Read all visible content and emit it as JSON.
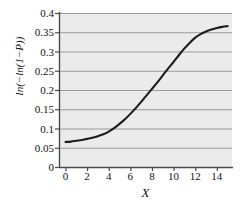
{
  "chart_data": {
    "type": "line",
    "title": "",
    "subtitle": "",
    "xlabel": "X",
    "ylabel": "ln(−ln(1−P))",
    "xlim": [
      -0.6,
      15.4
    ],
    "ylim": [
      0,
      0.4
    ],
    "xticks": [
      0,
      2,
      4,
      6,
      8,
      10,
      12,
      14
    ],
    "xtick_labels": [
      "0",
      "2",
      "4",
      "6",
      "8",
      "10",
      "12",
      "14"
    ],
    "yticks": [
      0,
      0.05,
      0.1,
      0.15,
      0.2,
      0.25,
      0.3,
      0.35,
      0.4
    ],
    "ytick_labels": [
      "0",
      "0.05",
      "0.1",
      "0.15",
      "0.2",
      "0.25",
      "0.3",
      "0.35",
      "0.4"
    ],
    "grid": "horizontal",
    "legend": "none",
    "plot_background": "#ebebeb",
    "grid_color": "#9a9a9a",
    "axis_color": "#4a4a4a",
    "line_color": "#1c1c1c",
    "line_width": 2.1,
    "series": [
      {
        "name": "ln(-ln(1-P))",
        "x": [
          0,
          0.5,
          1,
          1.5,
          2,
          2.5,
          3,
          3.5,
          4,
          4.5,
          5,
          5.5,
          6,
          6.5,
          7,
          7.5,
          8,
          8.5,
          9,
          9.5,
          10,
          10.5,
          11,
          11.5,
          12,
          12.5,
          13,
          13.5,
          14,
          14.5,
          15
        ],
        "y": [
          0.065,
          0.066,
          0.068,
          0.07,
          0.073,
          0.076,
          0.08,
          0.085,
          0.092,
          0.101,
          0.112,
          0.124,
          0.138,
          0.153,
          0.169,
          0.186,
          0.203,
          0.22,
          0.238,
          0.256,
          0.273,
          0.291,
          0.308,
          0.323,
          0.336,
          0.345,
          0.352,
          0.357,
          0.361,
          0.364,
          0.366
        ]
      }
    ],
    "annotations": []
  },
  "figure": {
    "axis_label_x": "X",
    "axis_label_y": "ln(−ln(1−P))"
  }
}
